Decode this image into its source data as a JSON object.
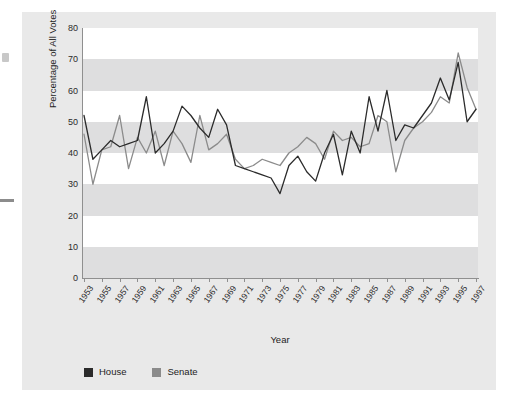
{
  "figure": {
    "background": "#e9e9e9",
    "plot_background": "#ffffff",
    "band_color": "#dededf"
  },
  "legend": {
    "position": "bottom-left",
    "entries": [
      {
        "label": "House",
        "color": "#2b2b2b"
      },
      {
        "label": "Senate",
        "color": "#8b8b8b"
      }
    ]
  },
  "chart_data": {
    "type": "line",
    "title": "",
    "xlabel": "Year",
    "ylabel": "Percentage of All Votes",
    "xlim": [
      1953,
      1997
    ],
    "ylim": [
      0,
      80
    ],
    "ytick_values": [
      0,
      10,
      20,
      30,
      40,
      50,
      60,
      70,
      80
    ],
    "ytick_labels": [
      "0",
      "10",
      "20",
      "30",
      "40",
      "50",
      "60",
      "70",
      "80"
    ],
    "xtick_labels": [
      "1953",
      "1955",
      "1957",
      "1959",
      "1961",
      "1963",
      "1965",
      "1967",
      "1969",
      "1971",
      "1973",
      "1975",
      "1977",
      "1979",
      "1981",
      "1983",
      "1985",
      "1987",
      "1989",
      "1991",
      "1993",
      "1995",
      "1997"
    ],
    "grid": "horizontal-bands",
    "legend_position": "bottom-left",
    "x": [
      1953,
      1954,
      1955,
      1956,
      1957,
      1958,
      1959,
      1960,
      1961,
      1962,
      1963,
      1964,
      1965,
      1966,
      1967,
      1968,
      1969,
      1970,
      1971,
      1972,
      1973,
      1974,
      1975,
      1976,
      1977,
      1978,
      1979,
      1980,
      1981,
      1982,
      1983,
      1984,
      1985,
      1986,
      1987,
      1988,
      1989,
      1990,
      1991,
      1992,
      1993,
      1994,
      1995,
      1996,
      1997
    ],
    "series": [
      {
        "name": "House",
        "color": "#2b2b2b",
        "values": [
          52,
          38,
          41,
          44,
          42,
          43,
          44,
          58,
          40,
          43,
          47,
          55,
          52,
          48,
          45,
          54,
          49,
          36,
          35,
          34,
          33,
          32,
          27,
          36,
          39,
          34,
          31,
          40,
          46,
          33,
          47,
          40,
          58,
          47,
          60,
          44,
          49,
          48,
          52,
          56,
          64,
          57,
          69,
          50,
          54
        ]
      },
      {
        "name": "Senate",
        "color": "#8b8b8b",
        "values": [
          46,
          30,
          41,
          42,
          52,
          35,
          45,
          40,
          47,
          36,
          47,
          43,
          37,
          52,
          41,
          43,
          46,
          38,
          35,
          36,
          38,
          37,
          36,
          40,
          42,
          45,
          43,
          38,
          47,
          44,
          45,
          42,
          43,
          52,
          50,
          34,
          44,
          48,
          50,
          53,
          58,
          56,
          72,
          61,
          54
        ]
      }
    ]
  }
}
